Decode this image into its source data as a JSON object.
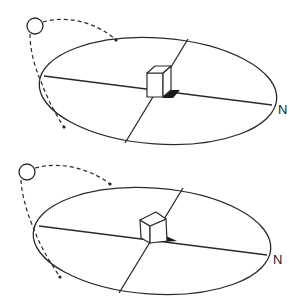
{
  "diagrams": [
    {
      "id": "top",
      "label_N": "N",
      "description": "Sun path around horizon with cube casting shadow",
      "ellipse": {
        "cx": 158,
        "cy": 91,
        "rx": 119,
        "ry": 54,
        "rotate": 4
      },
      "sun": {
        "cx": 35,
        "cy": 26,
        "r": 8
      }
    },
    {
      "id": "bottom",
      "label_N": "N",
      "description": "Sun path around horizon with rotated cube casting shadow",
      "ellipse": {
        "cx": 152,
        "cy": 241,
        "rx": 119,
        "ry": 53,
        "rotate": 4
      },
      "sun": {
        "cx": 27,
        "cy": 176,
        "r": 8
      }
    }
  ],
  "colors": {
    "stroke": "#2a2a2a",
    "shadow": "#1a1a1a",
    "background": "#ffffff"
  }
}
